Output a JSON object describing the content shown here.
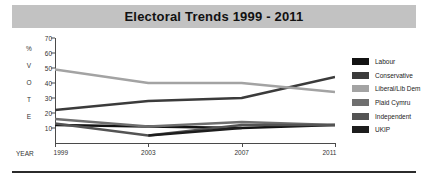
{
  "title": "Electoral Trends 1999 - 2011",
  "axis": {
    "y_label_stack": [
      "%",
      "V",
      "O",
      "T",
      "E"
    ],
    "x_label": "YEAR",
    "y_ticks": [
      "70",
      "60",
      "50",
      "40",
      "30",
      "20",
      "10"
    ],
    "x_ticks": [
      "1999",
      "2003",
      "2007",
      "2011"
    ]
  },
  "legend": {
    "items": [
      {
        "label": "Labour",
        "color": "#121212"
      },
      {
        "label": "Conservative",
        "color": "#3b3b3b"
      },
      {
        "label": "Liberal/Lib Dem",
        "color": "#a3a3a3"
      },
      {
        "label": "Plaid Cymru",
        "color": "#6f6f6f"
      },
      {
        "label": "Independent",
        "color": "#545454"
      },
      {
        "label": "UKIP",
        "color": "#1d1d1d"
      }
    ]
  },
  "colors": {
    "title_band": "#c2c2c2",
    "axis": "#4a4a4a",
    "text": "#222222",
    "bottom_rule": "#2b2b2b"
  },
  "chart_data": {
    "type": "line",
    "title": "Electoral Trends 1999 - 2011",
    "xlabel": "YEAR",
    "ylabel": "% VOTE",
    "x": [
      "1999",
      "2003",
      "2007",
      "2011"
    ],
    "ylim": [
      0,
      70
    ],
    "xlim": [
      "1999",
      "2011"
    ],
    "grid": false,
    "legend_position": "right",
    "y_ticks": [
      10,
      20,
      30,
      40,
      50,
      60,
      70
    ],
    "series": [
      {
        "name": "Labour",
        "color": "#121212",
        "values": [
          12,
          11,
          10,
          12
        ]
      },
      {
        "name": "Conservative",
        "color": "#3b3b3b",
        "values": [
          22,
          28,
          30,
          44
        ]
      },
      {
        "name": "Liberal/Lib Dem",
        "color": "#a3a3a3",
        "values": [
          49,
          40,
          40,
          34
        ]
      },
      {
        "name": "Plaid Cymru",
        "color": "#6f6f6f",
        "values": [
          16,
          11,
          14,
          12
        ]
      },
      {
        "name": "Independent",
        "color": "#545454",
        "values": [
          13,
          5,
          12,
          12
        ]
      },
      {
        "name": "UKIP",
        "color": "#1d1d1d",
        "values": [
          null,
          5,
          10,
          null
        ]
      }
    ]
  }
}
